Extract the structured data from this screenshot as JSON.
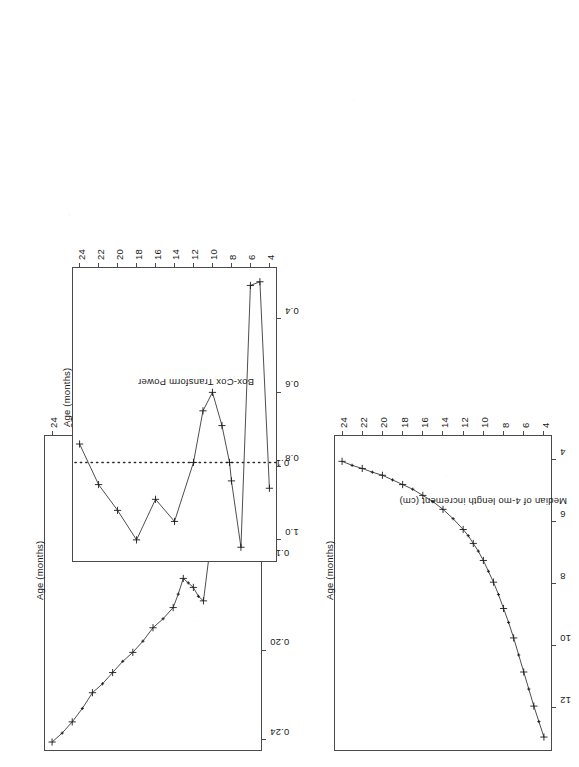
{
  "figure": {
    "background": "#ffffff",
    "ink_color": "#1a1a1a",
    "axis_color": "#4a4a4a",
    "rotation_degrees": 180,
    "panel_count": 3
  },
  "panels": [
    {
      "id": "panel-median-increment",
      "name": "Median of 4-mo length increment",
      "xlabel": "Age (months)",
      "ylabel": "Median of 4-mo length increment (cm)",
      "xticks": [
        "4",
        "6",
        "8",
        "10",
        "12",
        "14",
        "16",
        "18",
        "20",
        "22",
        "24"
      ],
      "yticks": [
        "4",
        "6",
        "8",
        "10",
        "12"
      ]
    },
    {
      "id": "panel-stdev-boxcox",
      "name": "St Dev Box-Cox Transformed",
      "xlabel": "Age (months)",
      "ylabel": "St Dev Box-Cox Transformed",
      "xticks": [
        "4",
        "6",
        "8",
        "10",
        "12",
        "14",
        "16",
        "18",
        "20",
        "22",
        "24"
      ],
      "yticks": [
        "0.12",
        "0.16",
        "0.20",
        "0.24"
      ]
    },
    {
      "id": "panel-boxcox-power",
      "name": "Box-Cox Transform Power",
      "xlabel": "Age (months)",
      "ylabel": "Box-Cox Transform Power",
      "xticks": [
        "4",
        "6",
        "8",
        "10",
        "12",
        "14",
        "16",
        "18",
        "20",
        "22",
        "24"
      ],
      "yticks": [
        "0.4",
        "0.6",
        "0.8",
        "1.0"
      ]
    }
  ],
  "chart_data": [
    {
      "type": "line",
      "id": "panel-median-increment",
      "title": "",
      "xlabel": "Age (months)",
      "ylabel": "Median of 4-mo length increment (cm)",
      "xlim": [
        3.2,
        24.8
      ],
      "ylim": [
        3.2,
        13.4
      ],
      "xticks": [
        4,
        6,
        8,
        10,
        12,
        14,
        16,
        18,
        20,
        22,
        24
      ],
      "yticks": [
        4,
        6,
        8,
        10,
        12
      ],
      "grid": false,
      "legend": "none",
      "marker": "plus",
      "x": [
        4,
        4.5,
        5,
        5.5,
        6,
        6.5,
        7,
        7.5,
        8,
        8.5,
        9,
        9.5,
        10,
        10.5,
        11,
        11.5,
        12,
        13,
        14,
        15,
        16,
        17,
        18,
        19,
        20,
        21,
        22,
        23,
        24
      ],
      "y": [
        12.95,
        12.45,
        11.95,
        11.4,
        10.85,
        10.3,
        9.75,
        9.25,
        8.8,
        8.35,
        7.95,
        7.6,
        7.25,
        6.95,
        6.7,
        6.45,
        6.25,
        5.9,
        5.6,
        5.35,
        5.15,
        4.95,
        4.8,
        4.65,
        4.5,
        4.4,
        4.28,
        4.18,
        4.05
      ]
    },
    {
      "type": "line",
      "id": "panel-stdev-boxcox",
      "title": "",
      "xlabel": "Age (months)",
      "ylabel": "St Dev Box-Cox Transformed",
      "xlim": [
        3.2,
        24.8
      ],
      "ylim": [
        0.104,
        0.245
      ],
      "xticks": [
        4,
        6,
        8,
        10,
        12,
        14,
        16,
        18,
        20,
        22,
        24
      ],
      "yticks": [
        0.12,
        0.16,
        0.2,
        0.24
      ],
      "grid": false,
      "legend": "none",
      "marker": "plus",
      "x": [
        4,
        4.5,
        5,
        5.5,
        6,
        6.5,
        7,
        7.5,
        8,
        8.5,
        9,
        9.5,
        10,
        10.5,
        11,
        11.5,
        12,
        13,
        14,
        15,
        16,
        17,
        18,
        19,
        20,
        21,
        22,
        23,
        24
      ],
      "y": [
        0.108,
        0.112,
        0.115,
        0.119,
        0.124,
        0.13,
        0.136,
        0.143,
        0.152,
        0.16,
        0.178,
        0.176,
        0.172,
        0.17,
        0.168,
        0.175,
        0.181,
        0.186,
        0.19,
        0.196,
        0.201,
        0.205,
        0.21,
        0.215,
        0.219,
        0.226,
        0.232,
        0.237,
        0.241
      ]
    },
    {
      "type": "line",
      "id": "panel-boxcox-power",
      "title": "",
      "xlabel": "Age (months)",
      "ylabel": "Box-Cox Transform Power",
      "xlim": [
        3.2,
        24.8
      ],
      "ylim": [
        0.26,
        1.06
      ],
      "xticks": [
        4,
        6,
        8,
        10,
        12,
        14,
        16,
        18,
        20,
        22,
        24
      ],
      "yticks": [
        0.4,
        0.6,
        0.8,
        1.0
      ],
      "grid": false,
      "legend": "none",
      "marker": "plus",
      "reference_line": {
        "y": 0.79,
        "style": "dotted"
      },
      "x": [
        4,
        5,
        6,
        7,
        8,
        8.2,
        9,
        10,
        11,
        12,
        14,
        16,
        18,
        20,
        22,
        24
      ],
      "y": [
        0.86,
        0.3,
        0.31,
        1.02,
        0.84,
        0.79,
        0.69,
        0.6,
        0.65,
        0.79,
        0.95,
        0.89,
        1.0,
        0.92,
        0.85,
        0.74
      ]
    }
  ]
}
